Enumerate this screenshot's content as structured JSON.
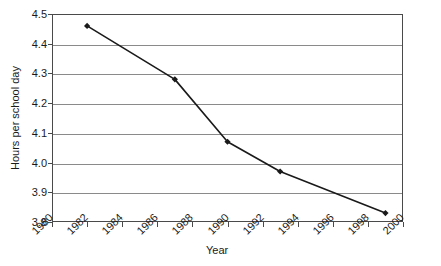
{
  "chart_data": {
    "type": "line",
    "title": "",
    "xlabel": "Year",
    "ylabel": "Hours per school day",
    "xlim": [
      1980,
      2000
    ],
    "ylim": [
      3.8,
      4.5
    ],
    "grid": true,
    "legend": "none",
    "marker": "diamond",
    "line_color": "#1a1a1a",
    "grid_color": "#8a8a8a",
    "frame_color": "#4a4a4a",
    "background_color": "#ffffff",
    "x": [
      1982,
      1987,
      1990,
      1993,
      1999
    ],
    "values": [
      4.46,
      4.28,
      4.07,
      3.97,
      3.83
    ],
    "series": [
      {
        "name": "Hours per school day",
        "x": [
          1982,
          1987,
          1990,
          1993,
          1999
        ],
        "values": [
          4.46,
          4.28,
          4.07,
          3.97,
          3.83
        ]
      }
    ],
    "xticks": [
      1980,
      1982,
      1984,
      1986,
      1988,
      1990,
      1992,
      1994,
      1996,
      1998,
      2000
    ],
    "xtick_labels": [
      "1980",
      "1982",
      "1984",
      "1986",
      "1988",
      "1990",
      "1992",
      "1994",
      "1996",
      "1998",
      "2000"
    ],
    "yticks": [
      3.8,
      3.9,
      4.0,
      4.1,
      4.2,
      4.3,
      4.4,
      4.5
    ],
    "ytick_labels": [
      "3.8",
      "3.9",
      "4.0",
      "4.1",
      "4.2",
      "4.3",
      "4.4",
      "4.5"
    ]
  }
}
